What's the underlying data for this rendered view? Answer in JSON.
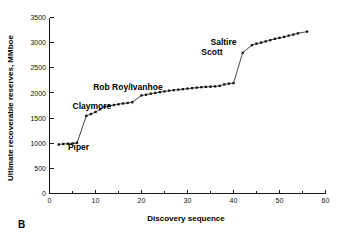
{
  "panel": {
    "label": "B"
  },
  "chart_data": {
    "type": "line",
    "title": "",
    "subtitle": "",
    "xlabel": "Discovery sequence",
    "ylabel": "Ultimate recoverable reserves, MMboe",
    "xlim": [
      0,
      60
    ],
    "ylim": [
      0,
      3500
    ],
    "xticks": [
      0,
      10,
      20,
      30,
      40,
      50,
      60
    ],
    "xticklabels": [
      "0",
      "10",
      "20",
      "30",
      "40",
      "50",
      "60"
    ],
    "xminorticks": [
      5,
      15,
      25,
      35,
      45,
      55
    ],
    "yticks": [
      0,
      500,
      1000,
      1500,
      2000,
      2500,
      3000,
      3500
    ],
    "yticklabels": [
      "0",
      "500",
      "1000",
      "1500",
      "2000",
      "2500",
      "3000",
      "3500"
    ],
    "grid": false,
    "legend": "none",
    "marker": "square",
    "series": [
      {
        "name": "Cumulative discovered reserves",
        "x": [
          2,
          3,
          4,
          5,
          6,
          8,
          9,
          10,
          11,
          12,
          13,
          14,
          15,
          16,
          17,
          18,
          20,
          21,
          22,
          23,
          24,
          25,
          26,
          27,
          28,
          29,
          30,
          31,
          32,
          33,
          34,
          35,
          36,
          37,
          38,
          39,
          40,
          42,
          44,
          45,
          46,
          47,
          48,
          49,
          50,
          51,
          52,
          53,
          54,
          56
        ],
        "values": [
          975,
          985,
          990,
          995,
          1010,
          1545,
          1580,
          1620,
          1675,
          1725,
          1745,
          1760,
          1775,
          1790,
          1800,
          1815,
          1950,
          1965,
          1985,
          2000,
          2015,
          2030,
          2045,
          2055,
          2065,
          2075,
          2085,
          2095,
          2105,
          2115,
          2120,
          2125,
          2130,
          2140,
          2170,
          2185,
          2195,
          2800,
          2950,
          2980,
          3000,
          3025,
          3050,
          3075,
          3095,
          3115,
          3140,
          3160,
          3185,
          3220
        ]
      }
    ],
    "annotations": [
      {
        "text": "Piper",
        "x": 4,
        "y": 860,
        "anchor": "start"
      },
      {
        "text": "Claymore",
        "x": 5,
        "y": 1690,
        "anchor": "start"
      },
      {
        "text": "Rob Roy/Ivanhoe",
        "x": 9.5,
        "y": 2060,
        "anchor": "start"
      },
      {
        "text": "Scott",
        "x": 33,
        "y": 2760,
        "anchor": "start"
      },
      {
        "text": "Saltire",
        "x": 35,
        "y": 2960,
        "anchor": "start"
      }
    ]
  }
}
